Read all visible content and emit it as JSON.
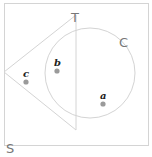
{
  "diagram": {
    "type": "venn",
    "universe": {
      "label": "S",
      "x": 4,
      "y": 3,
      "width": 144,
      "height": 142
    },
    "sets": [
      {
        "label": "T",
        "shape": "triangle",
        "points": [
          [
            4,
            72
          ],
          [
            76,
            15
          ],
          [
            76,
            130
          ]
        ],
        "label_pos": [
          76,
          18
        ]
      },
      {
        "label": "C",
        "shape": "circle",
        "cx": 90,
        "cy": 73,
        "r": 45,
        "label_pos": [
          124,
          46
        ]
      }
    ],
    "points": [
      {
        "label": "a",
        "x": 103,
        "y": 104,
        "label_y": 97
      },
      {
        "label": "b",
        "x": 57,
        "y": 71,
        "label_y": 64
      },
      {
        "label": "c",
        "x": 26,
        "y": 82,
        "label_y": 75
      }
    ],
    "colors": {
      "stroke": "#d4d4d4",
      "point": "#9a9a9a",
      "label": "#222222",
      "set_label": "#777777"
    }
  }
}
